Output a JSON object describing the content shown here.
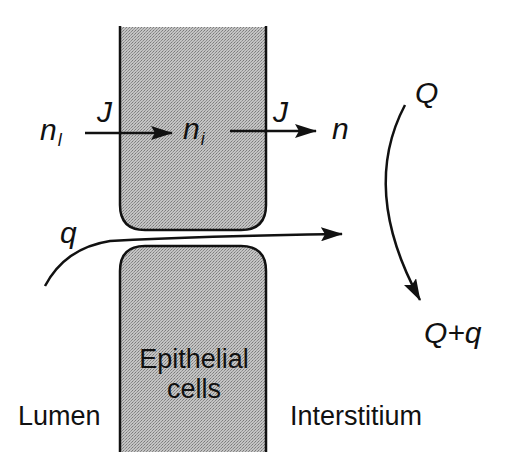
{
  "diagram": {
    "type": "transport-schematic",
    "regions": {
      "lumen": "Lumen",
      "epithelium_line1": "Epithelial",
      "epithelium_line2": "cells",
      "interstitium": "Interstitium"
    },
    "solute": {
      "lumen_conc": "n",
      "lumen_conc_sub": "l",
      "cell_conc": "n",
      "cell_conc_sub": "i",
      "interstitial_conc": "n",
      "flux_in": "J",
      "flux_out": "J"
    },
    "flow": {
      "paracellular": "q",
      "interstitial_in": "Q",
      "interstitial_out": "Q+q"
    },
    "colors": {
      "ink": "#111111",
      "cell_fill": "#b8b8b8",
      "background": "#ffffff"
    }
  }
}
